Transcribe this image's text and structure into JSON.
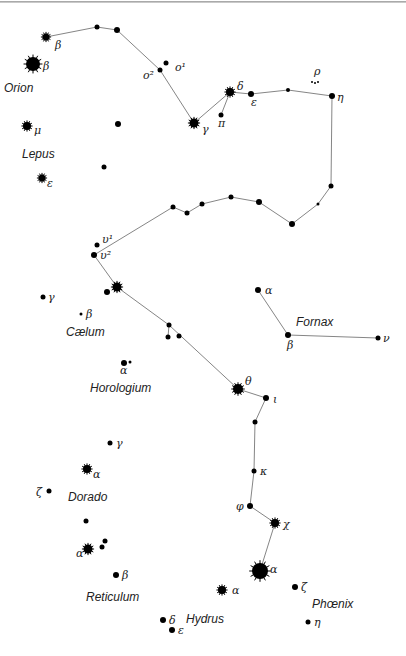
{
  "colors": {
    "background": "#ffffff",
    "star": "#000000",
    "line": "#777777",
    "text": "#222222"
  },
  "constellations": [
    {
      "name": "Orion",
      "x": 4,
      "y": 92
    },
    {
      "name": "Lepus",
      "x": 22,
      "y": 158
    },
    {
      "name": "Cælum",
      "x": 66,
      "y": 336
    },
    {
      "name": "Fornax",
      "x": 296,
      "y": 326
    },
    {
      "name": "Horologium",
      "x": 90,
      "y": 392
    },
    {
      "name": "Dorado",
      "x": 68,
      "y": 501
    },
    {
      "name": "Reticulum",
      "x": 86,
      "y": 601
    },
    {
      "name": "Hydrus",
      "x": 186,
      "y": 623
    },
    {
      "name": "Phœnix",
      "x": 312,
      "y": 608
    }
  ],
  "stars": [
    {
      "id": "ori-beta-small",
      "x": 46,
      "y": 37,
      "r": 3.5,
      "type": "spiky",
      "label": "β",
      "lx": 55,
      "ly": 49
    },
    {
      "id": "ori-beta",
      "x": 33,
      "y": 64,
      "r": 7,
      "type": "spiky",
      "label": "β",
      "lx": 43,
      "ly": 70
    },
    {
      "id": "eri-a1",
      "x": 97,
      "y": 27,
      "r": 2.5,
      "type": "dot"
    },
    {
      "id": "eri-a2",
      "x": 117,
      "y": 30,
      "r": 3,
      "type": "dot"
    },
    {
      "id": "eri-o2",
      "x": 160,
      "y": 70,
      "r": 2.5,
      "type": "dot",
      "label": "o²",
      "lx": 143,
      "ly": 79
    },
    {
      "id": "eri-o1",
      "x": 166,
      "y": 63,
      "r": 2.5,
      "type": "dot",
      "label": "o¹",
      "lx": 175,
      "ly": 71
    },
    {
      "id": "eri-gamma",
      "x": 194,
      "y": 123,
      "r": 4.5,
      "type": "spiky",
      "label": "γ",
      "lx": 202,
      "ly": 133
    },
    {
      "id": "eri-pi",
      "x": 221,
      "y": 115,
      "r": 2.5,
      "type": "dot",
      "label": "π",
      "lx": 218,
      "ly": 127
    },
    {
      "id": "eri-delta",
      "x": 230,
      "y": 92,
      "r": 4,
      "type": "spiky",
      "label": "δ",
      "lx": 237,
      "ly": 90
    },
    {
      "id": "eri-epsilon",
      "x": 251,
      "y": 94,
      "r": 3,
      "type": "dot",
      "label": "ε",
      "lx": 251,
      "ly": 106
    },
    {
      "id": "eri-b1",
      "x": 288,
      "y": 90,
      "r": 2,
      "type": "dot"
    },
    {
      "id": "eri-rho",
      "x": 315,
      "y": 82,
      "r": 1,
      "type": "cluster",
      "label": "ρ",
      "lx": 314,
      "ly": 75
    },
    {
      "id": "eri-eta",
      "x": 332,
      "y": 96,
      "r": 3,
      "type": "dot",
      "label": "η",
      "lx": 337,
      "ly": 101
    },
    {
      "id": "eri-c1",
      "x": 331,
      "y": 186,
      "r": 2.5,
      "type": "dot"
    },
    {
      "id": "eri-c2",
      "x": 318,
      "y": 204,
      "r": 1.5,
      "type": "dot"
    },
    {
      "id": "eri-c3",
      "x": 292,
      "y": 224,
      "r": 3,
      "type": "dot"
    },
    {
      "id": "eri-c4",
      "x": 259,
      "y": 202,
      "r": 3,
      "type": "dot"
    },
    {
      "id": "eri-c5",
      "x": 231,
      "y": 197,
      "r": 2.5,
      "type": "dot"
    },
    {
      "id": "eri-c6",
      "x": 202,
      "y": 204,
      "r": 2.5,
      "type": "dot"
    },
    {
      "id": "eri-c7",
      "x": 187,
      "y": 213,
      "r": 2.5,
      "type": "dot"
    },
    {
      "id": "eri-c8",
      "x": 173,
      "y": 207,
      "r": 2.5,
      "type": "dot"
    },
    {
      "id": "eri-ups1",
      "x": 97,
      "y": 245,
      "r": 2.5,
      "type": "dot",
      "label": "υ¹",
      "lx": 102,
      "ly": 243
    },
    {
      "id": "eri-ups2",
      "x": 94,
      "y": 255,
      "r": 3,
      "type": "dot",
      "label": "υ²",
      "lx": 100,
      "ly": 259
    },
    {
      "id": "eri-d1",
      "x": 117,
      "y": 287,
      "r": 4.5,
      "type": "spiky"
    },
    {
      "id": "eri-d1b",
      "x": 107,
      "y": 292,
      "r": 3,
      "type": "dot"
    },
    {
      "id": "eri-d2",
      "x": 169,
      "y": 325,
      "r": 2.5,
      "type": "dot"
    },
    {
      "id": "eri-d3",
      "x": 168,
      "y": 337,
      "r": 2.5,
      "type": "dot"
    },
    {
      "id": "eri-d4",
      "x": 179,
      "y": 336,
      "r": 2.5,
      "type": "dot"
    },
    {
      "id": "eri-theta",
      "x": 238,
      "y": 389,
      "r": 5,
      "type": "spiky",
      "label": "θ",
      "lx": 245,
      "ly": 385
    },
    {
      "id": "eri-iota",
      "x": 266,
      "y": 398,
      "r": 3,
      "type": "dot",
      "label": "ι",
      "lx": 273,
      "ly": 403
    },
    {
      "id": "eri-e1",
      "x": 255,
      "y": 422,
      "r": 2.5,
      "type": "dot"
    },
    {
      "id": "eri-kappa",
      "x": 254,
      "y": 471,
      "r": 2.5,
      "type": "dot",
      "label": "κ",
      "lx": 260,
      "ly": 475
    },
    {
      "id": "eri-phi",
      "x": 250,
      "y": 506,
      "r": 3,
      "type": "dot",
      "label": "φ",
      "lx": 236,
      "ly": 510
    },
    {
      "id": "eri-chi",
      "x": 275,
      "y": 523,
      "r": 4,
      "type": "spiky",
      "label": "χ",
      "lx": 283,
      "ly": 528
    },
    {
      "id": "phe-alpha",
      "x": 260,
      "y": 571,
      "r": 8,
      "type": "spiky",
      "label": "α",
      "lx": 270,
      "ly": 573
    },
    {
      "id": "phe-zeta",
      "x": 295,
      "y": 587,
      "r": 3,
      "type": "dot",
      "label": "ζ",
      "lx": 301,
      "ly": 591
    },
    {
      "id": "phe-eta",
      "x": 308,
      "y": 622,
      "r": 2.5,
      "type": "dot",
      "label": "η",
      "lx": 314,
      "ly": 626
    },
    {
      "id": "hyi-alpha",
      "x": 222,
      "y": 590,
      "r": 4,
      "type": "spiky",
      "label": "α",
      "lx": 232,
      "ly": 594
    },
    {
      "id": "hyi-delta",
      "x": 163,
      "y": 620,
      "r": 3,
      "type": "dot",
      "label": "δ",
      "lx": 169,
      "ly": 624
    },
    {
      "id": "hyi-epsilon",
      "x": 172,
      "y": 630,
      "r": 3,
      "type": "dot",
      "label": "ε",
      "lx": 178,
      "ly": 634
    },
    {
      "id": "for-alpha",
      "x": 258,
      "y": 290,
      "r": 3,
      "type": "dot",
      "label": "α",
      "lx": 265,
      "ly": 294
    },
    {
      "id": "for-beta",
      "x": 288,
      "y": 335,
      "r": 3,
      "type": "dot",
      "label": "β",
      "lx": 287,
      "ly": 349
    },
    {
      "id": "for-nu",
      "x": 378,
      "y": 338,
      "r": 2.5,
      "type": "dot",
      "label": "ν",
      "lx": 383,
      "ly": 342
    },
    {
      "id": "lep-mu",
      "x": 27,
      "y": 126,
      "r": 4,
      "type": "spiky",
      "label": "μ",
      "lx": 34,
      "ly": 134
    },
    {
      "id": "lep-epsilon",
      "x": 42,
      "y": 178,
      "r": 3.5,
      "type": "spiky",
      "label": "ε",
      "lx": 47,
      "ly": 187
    },
    {
      "id": "lep-a",
      "x": 118,
      "y": 124,
      "r": 3,
      "type": "dot"
    },
    {
      "id": "lep-b",
      "x": 104,
      "y": 167,
      "r": 2.5,
      "type": "dot"
    },
    {
      "id": "cae-gamma",
      "x": 43,
      "y": 297,
      "r": 2.5,
      "type": "dot",
      "label": "γ",
      "lx": 48,
      "ly": 301
    },
    {
      "id": "cae-beta",
      "x": 81,
      "y": 314,
      "r": 1.5,
      "type": "dot",
      "label": "β",
      "lx": 86,
      "ly": 318
    },
    {
      "id": "hor-alpha",
      "x": 124,
      "y": 363,
      "r": 3,
      "type": "dot",
      "label": "α",
      "lx": 120,
      "ly": 374
    },
    {
      "id": "hor-alpha-b",
      "x": 130,
      "y": 362,
      "r": 1.5,
      "type": "dot"
    },
    {
      "id": "dor-gamma",
      "x": 110,
      "y": 443,
      "r": 2.5,
      "type": "dot",
      "label": "γ",
      "lx": 116,
      "ly": 447
    },
    {
      "id": "dor-alpha",
      "x": 87,
      "y": 469,
      "r": 4,
      "type": "spiky",
      "label": "α",
      "lx": 93,
      "ly": 478
    },
    {
      "id": "dor-zeta",
      "x": 49,
      "y": 491,
      "r": 2.5,
      "type": "dot",
      "label": "ζ",
      "lx": 36,
      "ly": 496
    },
    {
      "id": "ret-a",
      "x": 86,
      "y": 521,
      "r": 2.5,
      "type": "dot"
    },
    {
      "id": "ret-alpha",
      "x": 88,
      "y": 549,
      "r": 4.5,
      "type": "spiky",
      "label": "α",
      "lx": 76,
      "ly": 557
    },
    {
      "id": "ret-b1",
      "x": 102,
      "y": 547,
      "r": 2.5,
      "type": "dot"
    },
    {
      "id": "ret-b2",
      "x": 105,
      "y": 541,
      "r": 2.5,
      "type": "dot"
    },
    {
      "id": "ret-beta",
      "x": 116,
      "y": 575,
      "r": 3,
      "type": "dot",
      "label": "β",
      "lx": 122,
      "ly": 579
    }
  ],
  "lines": [
    [
      "ori-beta-small",
      "eri-a1"
    ],
    [
      "eri-a1",
      "eri-a2"
    ],
    [
      "eri-a2",
      "eri-o2"
    ],
    [
      "eri-o2",
      "eri-gamma"
    ],
    [
      "eri-gamma",
      "eri-delta"
    ],
    [
      "eri-pi",
      "eri-delta"
    ],
    [
      "eri-delta",
      "eri-epsilon"
    ],
    [
      "eri-epsilon",
      "eri-b1"
    ],
    [
      "eri-b1",
      "eri-eta"
    ],
    [
      "eri-eta",
      "eri-c1"
    ],
    [
      "eri-c1",
      "eri-c2"
    ],
    [
      "eri-c2",
      "eri-c3"
    ],
    [
      "eri-c3",
      "eri-c4"
    ],
    [
      "eri-c4",
      "eri-c5"
    ],
    [
      "eri-c5",
      "eri-c6"
    ],
    [
      "eri-c6",
      "eri-c7"
    ],
    [
      "eri-c7",
      "eri-c8"
    ],
    [
      "eri-c8",
      "eri-ups2"
    ],
    [
      "eri-ups2",
      "eri-d1"
    ],
    [
      "eri-d1",
      "eri-d2"
    ],
    [
      "eri-d2",
      "eri-d3"
    ],
    [
      "eri-d2",
      "eri-theta"
    ],
    [
      "eri-theta",
      "eri-iota"
    ],
    [
      "eri-iota",
      "eri-e1"
    ],
    [
      "eri-e1",
      "eri-kappa"
    ],
    [
      "eri-kappa",
      "eri-phi"
    ],
    [
      "eri-phi",
      "eri-chi"
    ],
    [
      "eri-chi",
      "phe-alpha"
    ],
    [
      "for-alpha",
      "for-beta"
    ],
    [
      "for-beta",
      "for-nu"
    ]
  ]
}
